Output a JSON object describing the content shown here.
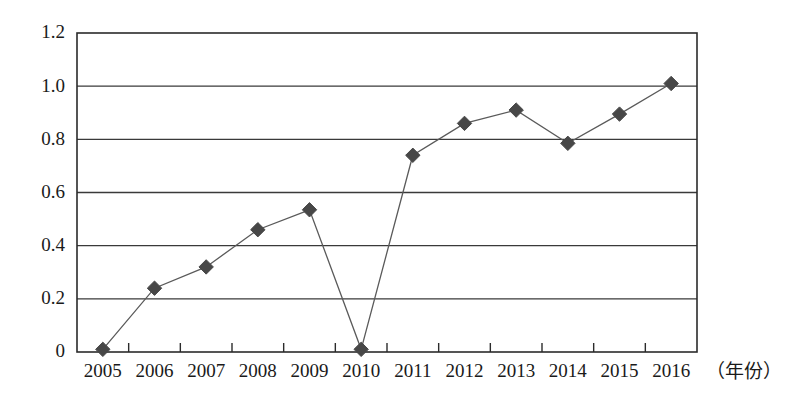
{
  "chart_data": {
    "type": "line",
    "title": "",
    "subtitle": "",
    "xlabel": "（年份）",
    "ylabel": "",
    "categories": [
      "2005",
      "2006",
      "2007",
      "2008",
      "2009",
      "2010",
      "2011",
      "2012",
      "2013",
      "2014",
      "2015",
      "2016"
    ],
    "values": [
      0.01,
      0.24,
      0.32,
      0.46,
      0.535,
      0.01,
      0.74,
      0.86,
      0.91,
      0.785,
      0.895,
      1.01
    ],
    "series": [
      {
        "name": "",
        "values": [
          0.01,
          0.24,
          0.32,
          0.46,
          0.535,
          0.01,
          0.74,
          0.86,
          0.91,
          0.785,
          0.895,
          1.01
        ]
      }
    ],
    "ylim": [
      0,
      1.2
    ],
    "yticks": [
      0,
      0.2,
      0.4,
      0.6,
      0.8,
      1.0,
      1.2
    ],
    "ytick_labels": [
      "0",
      "0.2",
      "0.4",
      "0.6",
      "0.8",
      "1.0",
      "1.2"
    ],
    "xtick_labels": [
      "2005",
      "2006",
      "2007",
      "2008",
      "2009",
      "2010",
      "2011",
      "2012",
      "2013",
      "2014",
      "2015",
      "2016"
    ],
    "grid": true,
    "grid_axis": "y",
    "legend": false,
    "legend_position": "none",
    "marker": "diamond",
    "annotations": [],
    "colors": {
      "line": "#5a5a5a",
      "marker": "#474747",
      "axis": "#2b2b2b",
      "grid": "#3a3a3a",
      "background": "#ffffff",
      "text": "#1a1a1a"
    }
  },
  "plot_geometry": {
    "left": 77,
    "right": 697,
    "top": 33,
    "bottom": 352
  }
}
